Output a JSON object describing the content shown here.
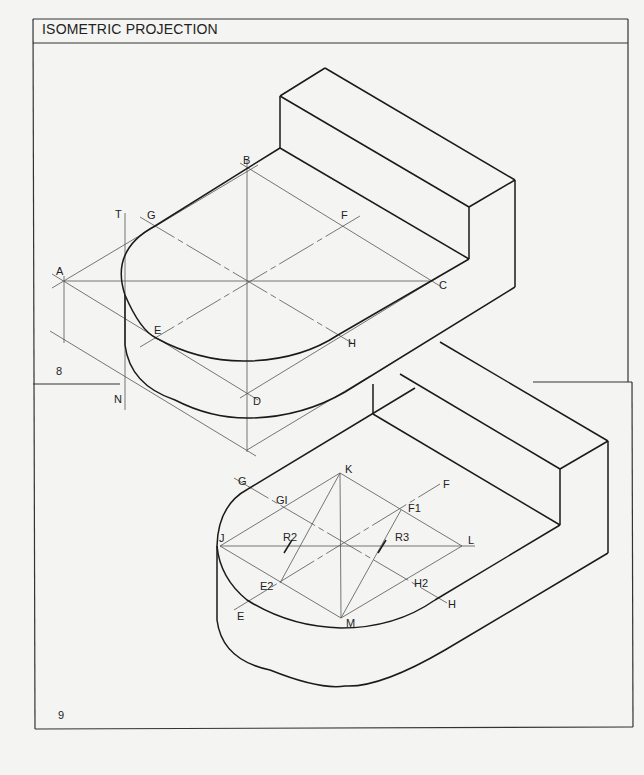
{
  "header": {
    "title": "ISOMETRIC PROJECTION"
  },
  "figures": [
    {
      "number": "8",
      "points": {
        "A": "A",
        "B": "B",
        "C": "C",
        "D": "D",
        "E": "E",
        "F": "F",
        "G": "G",
        "H": "H",
        "T": "T",
        "N": "N"
      }
    },
    {
      "number": "9",
      "points": {
        "G": "G",
        "G1": "GI",
        "F": "F",
        "F1": "F1",
        "J": "J",
        "K": "K",
        "L": "L",
        "M": "M",
        "E": "E",
        "E2": "E2",
        "H": "H",
        "H2": "H2",
        "R2": "R2",
        "R3": "R3"
      }
    }
  ],
  "colors": {
    "paper": "#f4f4f2",
    "ink": "#1a1a1a"
  }
}
